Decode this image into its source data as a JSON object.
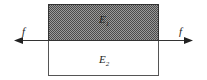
{
  "diagram": {
    "upper_region": {
      "symbol": "E",
      "subscript": "1",
      "fill": "hatched-gray"
    },
    "lower_region": {
      "symbol": "E",
      "subscript": "2",
      "fill": "#ffffff"
    },
    "left_force": {
      "label": "f",
      "direction": "left"
    },
    "right_force": {
      "label": "f",
      "direction": "right"
    }
  },
  "colors": {
    "stroke": "#333333",
    "shade": "#7a7a7a"
  }
}
